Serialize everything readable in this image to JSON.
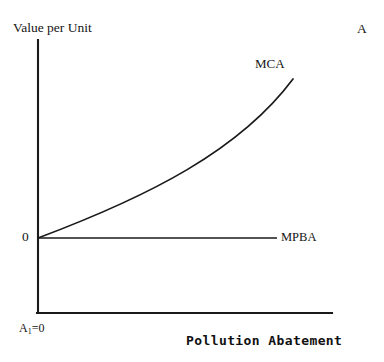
{
  "figure": {
    "panel_letter": "A",
    "background_color": "#ffffff",
    "line_color": "#1a1a1a"
  },
  "axes": {
    "y_title": "Value per Unit",
    "x_title": "Pollution Abatement",
    "origin_label": "0",
    "corner_label_base": "A",
    "corner_label_sub": "1",
    "corner_label_rest": "=0"
  },
  "chart_data": {
    "type": "line",
    "title": "",
    "xlabel": "Pollution Abatement",
    "ylabel": "Value per Unit",
    "grid": false,
    "legend": "inline-curve-labels",
    "xlim": [
      0,
      1
    ],
    "ylim": [
      0,
      1
    ],
    "annotations": [
      {
        "text": "MCA",
        "x": 0.86,
        "y": 0.9
      },
      {
        "text": "MPBA",
        "x": 0.96,
        "y": 0.0
      },
      {
        "text": "0",
        "x": 0.0,
        "y": 0.0
      },
      {
        "text": "A1=0",
        "x": 0.0,
        "y": -0.38
      },
      {
        "text": "A",
        "x": 1.28,
        "y": 1.08
      }
    ],
    "series": [
      {
        "name": "MCA",
        "label": "MCA",
        "description": "Marginal Cost of Abatement: convex increasing curve from origin",
        "x": [
          0.0,
          0.1,
          0.2,
          0.3,
          0.4,
          0.5,
          0.6,
          0.7,
          0.8,
          0.9,
          1.0
        ],
        "y": [
          0.0,
          0.08,
          0.165,
          0.255,
          0.35,
          0.45,
          0.555,
          0.665,
          0.78,
          0.89,
          1.0
        ]
      },
      {
        "name": "MPBA",
        "label": "MPBA",
        "description": "Marginal Private Benefit of Abatement: constant at zero",
        "x": [
          0.0,
          1.0
        ],
        "y": [
          0.0,
          0.0
        ]
      }
    ]
  },
  "geometry": {
    "y_axis": {
      "x": 38,
      "y_top": 40,
      "y_bottom": 313
    },
    "x_axis_base": {
      "y": 313,
      "x_left": 38,
      "x_right": 332
    },
    "mpba_line": {
      "y": 238,
      "x_left": 38,
      "x_right": 277
    },
    "mca_curve": {
      "start": [
        38,
        238
      ],
      "control_1": [
        150,
        196
      ],
      "control_2": [
        240,
        150
      ],
      "end": [
        293,
        79
      ]
    }
  }
}
